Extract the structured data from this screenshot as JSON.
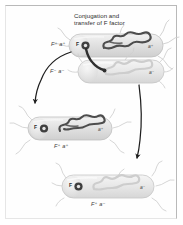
{
  "figure": {
    "domain_type": "diagram",
    "background_color": "#ffffff",
    "frame_color": "#b9b9b9"
  },
  "title": {
    "line1": "Conjugation and",
    "line2": "transfer of F factor"
  },
  "colors": {
    "cell_fill_light": "#e9e9e9",
    "cell_fill_mid": "#dcdcdc",
    "cell_outline": "#c2c2c2",
    "chromosome_dark": "#4a4a4a",
    "chromosome_light": "#d2d2d2",
    "plasmid_dark": "#3b3b3b",
    "arrow_color": "#1f1f1f",
    "pilus_color": "#2b2b2b",
    "flagella_color": "#cfcfcf",
    "text_color": "#3a3a3a"
  },
  "cells": [
    {
      "id": "donor-cell",
      "role": "donor",
      "genotype_label": "F⁺ a⁺",
      "plasmid_label": "F",
      "plasmid_state": "present",
      "chromosome_style": "dark",
      "chromosome_gene": "a⁺",
      "position": "top-right"
    },
    {
      "id": "recipient-cell",
      "role": "recipient",
      "genotype_label": "F⁻ a⁻",
      "plasmid_label": "",
      "plasmid_state": "absent",
      "chromosome_style": "light",
      "chromosome_gene": "a⁻",
      "position": "upper-middle-right"
    },
    {
      "id": "product-cell-donor",
      "role": "product-original-donor",
      "genotype_label": "F⁺ a⁺",
      "plasmid_label": "F",
      "plasmid_state": "present",
      "chromosome_style": "dark",
      "chromosome_gene": "a⁺",
      "position": "middle-left"
    },
    {
      "id": "product-cell-recipient",
      "role": "product-converted-recipient",
      "genotype_label": "F⁺ a⁻",
      "plasmid_label": "F",
      "plasmid_state": "present",
      "chromosome_style": "light",
      "chromosome_gene": "a⁻",
      "position": "bottom-right"
    }
  ],
  "connectors": [
    {
      "id": "conjugation-pilus",
      "type": "pilus-tube",
      "from": "donor-cell",
      "to": "recipient-cell",
      "description": "dark conjugation tube carrying F factor"
    },
    {
      "id": "arrow-left",
      "type": "curved-arrow",
      "from": "donor-cell",
      "to": "product-cell-donor"
    },
    {
      "id": "arrow-right",
      "type": "curved-arrow",
      "from": "recipient-cell",
      "to": "product-cell-recipient"
    }
  ],
  "superscripts": {
    "plus": "+",
    "minus": "−"
  }
}
